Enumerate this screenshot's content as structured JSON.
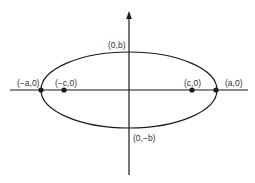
{
  "diagram": {
    "colors": {
      "stroke": "#1a1a1a",
      "text": "#333333",
      "background": "#ffffff"
    },
    "axes": {
      "x_axis": {
        "label": "",
        "arrow": false
      },
      "y_axis": {
        "label": "",
        "arrow": true
      }
    },
    "ellipse": {
      "center": "(0,0)",
      "major_axis": "horizontal"
    },
    "points": [
      {
        "id": "left-vertex",
        "label": "(−a,0)",
        "marked": true
      },
      {
        "id": "left-focus",
        "label": "(−c,0)",
        "marked": true
      },
      {
        "id": "right-focus",
        "label": "(c,0)",
        "marked": true
      },
      {
        "id": "right-vertex",
        "label": "(a,0)",
        "marked": true
      },
      {
        "id": "top-co-vertex",
        "label": "(0,b)",
        "marked": false
      },
      {
        "id": "bottom-co-vertex",
        "label": "(0,−b)",
        "marked": false
      }
    ]
  }
}
